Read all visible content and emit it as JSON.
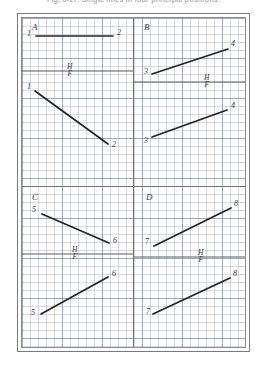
{
  "figure": {
    "caption": "Fig. 6-27.   Single lines in four principal positions.",
    "paper": "graph-grid",
    "grid_cell_px": 8,
    "line_color": "#2a2a2a",
    "reference_line_color": "#444444",
    "grid_color": "#7a8caa",
    "frame_color": "#7b7b7b"
  },
  "reference_label": {
    "top": "H",
    "bottom": "F"
  },
  "panels": [
    {
      "letter": "A",
      "quadrant": "top-left",
      "top_view": {
        "start_label": "1",
        "end_label": "2",
        "orientation": "horizontal"
      },
      "front_view": {
        "start_label": "1",
        "end_label": "2",
        "orientation": "descending"
      }
    },
    {
      "letter": "B",
      "quadrant": "top-right",
      "top_view": {
        "start_label": "3",
        "end_label": "4",
        "orientation": "ascending"
      },
      "front_view": {
        "start_label": "3",
        "end_label": "4",
        "orientation": "ascending"
      }
    },
    {
      "letter": "C",
      "quadrant": "bottom-left",
      "top_view": {
        "start_label": "5",
        "end_label": "6",
        "orientation": "descending"
      },
      "front_view": {
        "start_label": "5",
        "end_label": "6",
        "orientation": "ascending"
      }
    },
    {
      "letter": "D",
      "quadrant": "bottom-right",
      "top_view": {
        "start_label": "7",
        "end_label": "8",
        "orientation": "ascending"
      },
      "front_view": {
        "start_label": "7",
        "end_label": "8",
        "orientation": "ascending"
      }
    }
  ]
}
